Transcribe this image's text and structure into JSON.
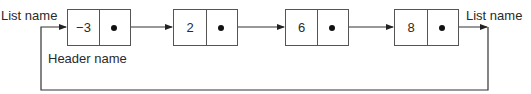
{
  "diagram": {
    "type": "circular singly linked list with header node",
    "list_name_left": "List name",
    "list_name_right": "List name",
    "header_label": "Header name",
    "nodes": [
      {
        "value": "−3",
        "role": "header"
      },
      {
        "value": "2"
      },
      {
        "value": "6"
      },
      {
        "value": "8"
      }
    ],
    "edges": [
      {
        "from": "List name (left)",
        "to": "node 0"
      },
      {
        "from": "node 0",
        "to": "node 1"
      },
      {
        "from": "node 1",
        "to": "node 2"
      },
      {
        "from": "node 2",
        "to": "node 3"
      },
      {
        "from": "node 3",
        "to": "List name (right)"
      },
      {
        "from": "node 3",
        "to": "node 0",
        "note": "wrap-around link along bottom"
      }
    ],
    "colors": {
      "line": "#333333",
      "box_border": "#555555",
      "text": "#2a2a2a",
      "background": "#ffffff"
    }
  }
}
